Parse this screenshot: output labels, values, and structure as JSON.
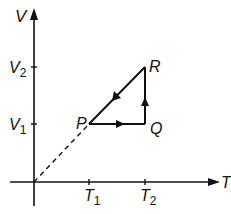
{
  "diagram": {
    "axes": {
      "y_label": "V",
      "x_label": "T",
      "y_ticks": [
        {
          "main": "V",
          "sub": "2"
        },
        {
          "main": "V",
          "sub": "1"
        }
      ],
      "x_ticks": [
        {
          "main": "T",
          "sub": "1"
        },
        {
          "main": "T",
          "sub": "2"
        }
      ]
    },
    "points": {
      "P": "P",
      "Q": "Q",
      "R": "R"
    },
    "paths": [
      {
        "from": "P",
        "to": "Q",
        "direction": "right"
      },
      {
        "from": "Q",
        "to": "R",
        "direction": "up"
      },
      {
        "from": "R",
        "to": "P",
        "direction": "down-left"
      },
      {
        "from": "O",
        "to": "P",
        "style": "dashed"
      }
    ],
    "colors": {
      "ink": "#111111",
      "background": "#ffffff"
    }
  }
}
